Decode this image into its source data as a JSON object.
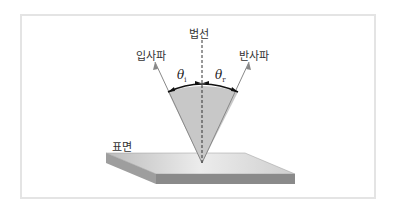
{
  "diagram": {
    "labels": {
      "normal": "법선",
      "incident": "입사파",
      "reflected": "반사파",
      "surface": "표면",
      "theta_i": "θ",
      "theta_i_sub": "i",
      "theta_r": "θ",
      "theta_r_sub": "r"
    },
    "colors": {
      "cone_fill": "#c8c8c8",
      "surface_top": "#d6d6d6",
      "surface_side": "#8a8a8a",
      "arc": "#111111",
      "normal_line": "#333333",
      "frame": "#e4e4e4"
    }
  }
}
